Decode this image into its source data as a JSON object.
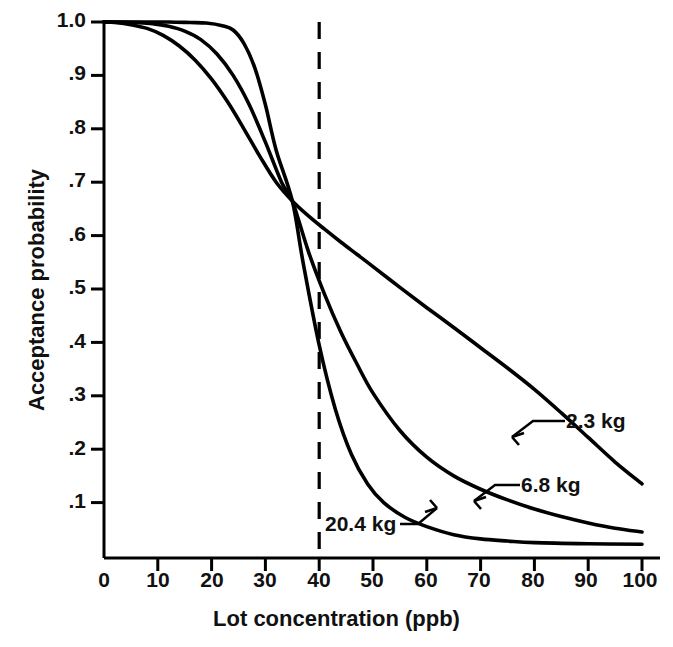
{
  "chart_data": {
    "type": "line",
    "title": "",
    "xlabel": "Lot concentration (ppb)",
    "ylabel": "Acceptance probability",
    "xlim": [
      0,
      100
    ],
    "ylim": [
      0,
      1.0
    ],
    "grid": false,
    "legend_position": "inline-annotations",
    "xticks": [
      0,
      10,
      20,
      30,
      40,
      50,
      60,
      70,
      80,
      90,
      100
    ],
    "xtick_labels": [
      "0",
      "10",
      "20",
      "30",
      "40",
      "50",
      "60",
      "70",
      "80",
      "90",
      "100"
    ],
    "yticks": [
      0.1,
      0.2,
      0.3,
      0.4,
      0.5,
      0.6,
      0.7,
      0.8,
      0.9,
      1.0
    ],
    "ytick_labels": [
      ".1",
      ".2",
      ".3",
      ".4",
      ".5",
      ".6",
      ".7",
      ".8",
      ".9",
      "1.0"
    ],
    "annotations": [
      {
        "text": "40",
        "type": "reference-line",
        "x": 40,
        "style": "dashed-vertical",
        "from_y": 0,
        "to_y": 1.0
      }
    ],
    "series": [
      {
        "name": "2.3 kg",
        "label": "2.3 kg",
        "x": [
          0,
          2,
          5,
          8,
          11,
          14,
          17,
          20,
          23,
          26,
          29,
          32,
          35,
          38,
          41,
          44,
          47,
          50,
          55,
          60,
          65,
          70,
          75,
          80,
          85,
          90,
          95,
          100
        ],
        "y": [
          1.0,
          0.999,
          0.995,
          0.988,
          0.975,
          0.955,
          0.928,
          0.893,
          0.85,
          0.8,
          0.748,
          0.7,
          0.665,
          0.637,
          0.612,
          0.588,
          0.565,
          0.542,
          0.503,
          0.465,
          0.428,
          0.39,
          0.352,
          0.312,
          0.268,
          0.222,
          0.176,
          0.135
        ]
      },
      {
        "name": "6.8 kg",
        "label": "6.8 kg",
        "x": [
          0,
          3,
          6,
          9,
          12,
          15,
          18,
          21,
          24,
          27,
          30,
          33,
          35,
          38,
          41,
          44,
          47,
          50,
          55,
          60,
          65,
          70,
          75,
          80,
          85,
          90,
          95,
          100
        ],
        "y": [
          1.0,
          1.0,
          0.999,
          0.997,
          0.992,
          0.983,
          0.967,
          0.94,
          0.9,
          0.845,
          0.775,
          0.7,
          0.665,
          0.57,
          0.49,
          0.42,
          0.36,
          0.305,
          0.235,
          0.185,
          0.15,
          0.125,
          0.105,
          0.088,
          0.074,
          0.062,
          0.052,
          0.045
        ]
      },
      {
        "name": "20.4 kg",
        "label": "20.4 kg",
        "x": [
          0,
          4,
          8,
          12,
          16,
          19,
          22,
          24,
          26,
          28,
          30,
          32,
          35,
          37,
          40,
          43,
          46,
          49,
          52,
          56,
          60,
          65,
          70,
          75,
          80,
          90,
          100
        ],
        "y": [
          1.0,
          1.0,
          1.0,
          1.0,
          0.999,
          0.998,
          0.993,
          0.985,
          0.96,
          0.915,
          0.845,
          0.76,
          0.665,
          0.55,
          0.395,
          0.275,
          0.19,
          0.135,
          0.1,
          0.072,
          0.055,
          0.04,
          0.032,
          0.028,
          0.025,
          0.023,
          0.022
        ]
      }
    ]
  },
  "labels": {
    "series_2_3": "2.3  kg",
    "series_6_8": "6.8  kg",
    "series_20_4": "20.4  kg",
    "xaxis_title": "Lot concentration (ppb)",
    "yaxis_title": "Acceptance probability"
  },
  "colors": {
    "line": "#000000",
    "axis": "#000000",
    "background": "#ffffff"
  }
}
